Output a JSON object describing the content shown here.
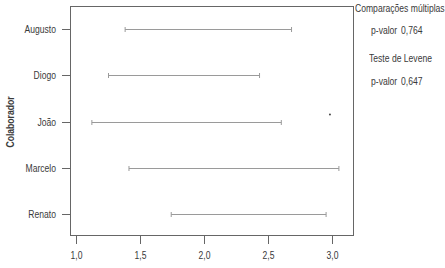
{
  "chart_data": {
    "type": "interval",
    "title": "",
    "xlabel": "",
    "ylabel": "Colaborador",
    "xlim": [
      0.95,
      3.1
    ],
    "x_ticks": [
      "1,0",
      "1,5",
      "2,0",
      "2,5",
      "3,0"
    ],
    "x_tick_values": [
      1.0,
      1.5,
      2.0,
      2.5,
      3.0
    ],
    "grid": false,
    "categories": [
      "Augusto",
      "Diogo",
      "João",
      "Marcelo",
      "Renato"
    ],
    "intervals": [
      {
        "name": "Augusto",
        "low": 1.38,
        "high": 2.68
      },
      {
        "name": "Diogo",
        "low": 1.25,
        "high": 2.43
      },
      {
        "name": "João",
        "low": 1.12,
        "high": 2.6
      },
      {
        "name": "Marcelo",
        "low": 1.41,
        "high": 3.05
      },
      {
        "name": "Renato",
        "low": 1.74,
        "high": 2.95
      }
    ],
    "outliers": [
      {
        "category": "João",
        "x": 2.98
      }
    ],
    "annotations": {
      "multiple_comparisons_title": "Comparações múltiplas",
      "multiple_comparisons_pvalue_label": "p-valor",
      "multiple_comparisons_pvalue": "0,764",
      "levene_title": "Teste de Levene",
      "levene_pvalue_label": "p-valor",
      "levene_pvalue": "0,647"
    },
    "colors": {
      "interval": "#9a9a9a",
      "axis": "#555555",
      "text": "#3a3a3a"
    }
  }
}
